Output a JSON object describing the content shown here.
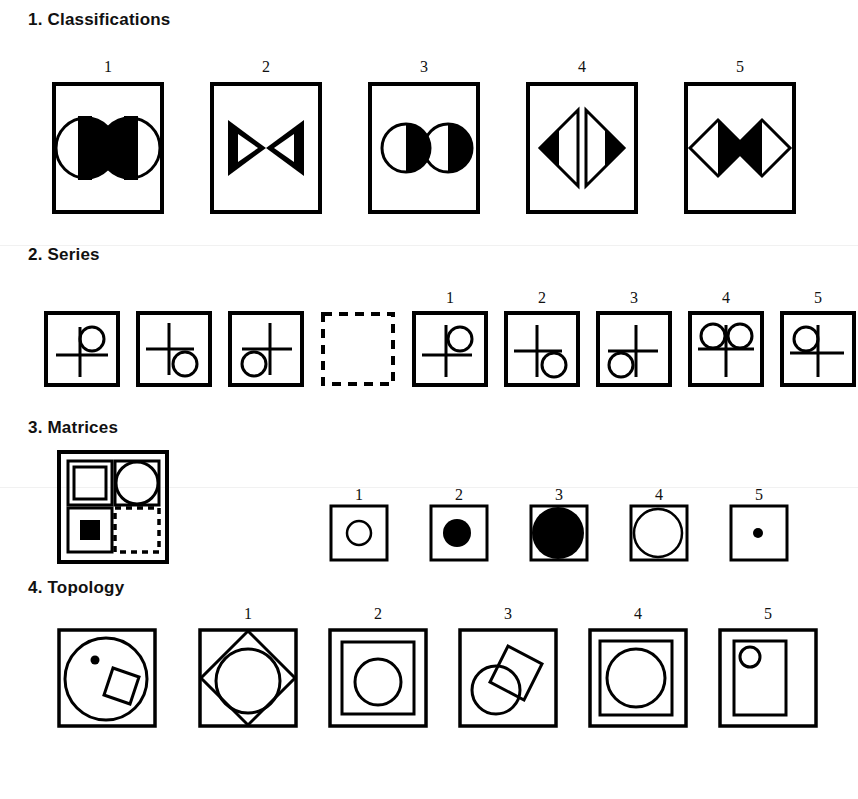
{
  "page": {
    "background_color": "#ffffff",
    "ink_color": "#000000",
    "width": 858,
    "height": 799
  },
  "sections": [
    {
      "id": "classifications",
      "number": "1.",
      "title": "1. Classifications",
      "title_x": 28,
      "title_y": 10,
      "kind": "classification",
      "stem": [],
      "options": [
        {
          "label": "1",
          "num_x": 108,
          "num_y": 58,
          "box_x": 52,
          "box_y": 82,
          "box_w": 112,
          "box_h": 132,
          "content": "two-circles-half-filled-inner"
        },
        {
          "label": "2",
          "num_x": 266,
          "num_y": 58,
          "box_x": 210,
          "box_y": 82,
          "box_w": 112,
          "box_h": 132,
          "content": "two-triangles-pointing-inward-filled"
        },
        {
          "label": "3",
          "num_x": 424,
          "num_y": 58,
          "box_x": 368,
          "box_y": 82,
          "box_w": 112,
          "box_h": 132,
          "content": "two-circles-right-half-filled"
        },
        {
          "label": "4",
          "num_x": 582,
          "num_y": 58,
          "box_x": 526,
          "box_y": 82,
          "box_w": 112,
          "box_h": 132,
          "content": "two-triangles-pointing-outward-half-filled"
        },
        {
          "label": "5",
          "num_x": 740,
          "num_y": 58,
          "box_x": 684,
          "box_y": 82,
          "box_w": 112,
          "box_h": 132,
          "content": "two-diamonds-half-filled-inner"
        }
      ]
    },
    {
      "id": "series",
      "number": "2.",
      "title": "2. Series",
      "title_x": 28,
      "title_y": 245,
      "kind": "series",
      "stem": [
        {
          "box_x": 44,
          "box_y": 311,
          "box_w": 76,
          "box_h": 76,
          "content": "cross-circle-top-right"
        },
        {
          "box_x": 136,
          "box_y": 311,
          "box_w": 76,
          "box_h": 76,
          "content": "cross-circle-bottom-right"
        },
        {
          "box_x": 228,
          "box_y": 311,
          "box_w": 76,
          "box_h": 76,
          "content": "cross-circle-bottom-left"
        },
        {
          "box_x": 320,
          "box_y": 311,
          "box_w": 76,
          "box_h": 76,
          "content": "empty-dashed-answer-slot"
        }
      ],
      "options": [
        {
          "label": "1",
          "num_x": 450,
          "num_y": 289,
          "box_x": 412,
          "box_y": 311,
          "box_w": 76,
          "box_h": 76,
          "content": "cross-circle-top-right"
        },
        {
          "label": "2",
          "num_x": 542,
          "num_y": 289,
          "box_x": 504,
          "box_y": 311,
          "box_w": 76,
          "box_h": 76,
          "content": "cross-circle-bottom-right"
        },
        {
          "label": "3",
          "num_x": 634,
          "num_y": 289,
          "box_x": 596,
          "box_y": 311,
          "box_w": 76,
          "box_h": 76,
          "content": "cross-circle-bottom-left"
        },
        {
          "label": "4",
          "num_x": 726,
          "num_y": 289,
          "box_x": 688,
          "box_y": 311,
          "box_w": 76,
          "box_h": 76,
          "content": "cross-two-circles-top"
        },
        {
          "label": "5",
          "num_x": 818,
          "num_y": 289,
          "box_x": 780,
          "box_y": 311,
          "box_w": 76,
          "box_h": 76,
          "content": "cross-circle-top-left"
        }
      ]
    },
    {
      "id": "matrices",
      "number": "3.",
      "title": "3. Matrices",
      "title_x": 28,
      "title_y": 418,
      "kind": "matrix",
      "stem": [
        {
          "box_x": 57,
          "box_y": 450,
          "box_w": 110,
          "box_h": 112,
          "content": "matrix-2x2-square-circle-smallfilledsquare-blank",
          "cells": [
            "large-outline-square",
            "large-outline-circle",
            "small-filled-square",
            "blank-dashed-cell"
          ]
        }
      ],
      "options": [
        {
          "label": "1",
          "num_x": 359,
          "num_y": 491,
          "box_x": 329,
          "box_y": 506,
          "box_w": 60,
          "box_h": 56,
          "content": "small-outline-circle"
        },
        {
          "label": "2",
          "num_x": 459,
          "num_y": 491,
          "box_x": 429,
          "box_y": 506,
          "box_w": 60,
          "box_h": 56,
          "content": "medium-filled-circle"
        },
        {
          "label": "3",
          "num_x": 559,
          "num_y": 491,
          "box_x": 529,
          "box_y": 506,
          "box_w": 60,
          "box_h": 56,
          "content": "large-filled-circle"
        },
        {
          "label": "4",
          "num_x": 659,
          "num_y": 491,
          "box_x": 629,
          "box_y": 506,
          "box_w": 60,
          "box_h": 56,
          "content": "large-outline-circle"
        },
        {
          "label": "5",
          "num_x": 759,
          "num_y": 491,
          "box_x": 729,
          "box_y": 506,
          "box_w": 60,
          "box_h": 56,
          "content": "tiny-filled-dot"
        }
      ]
    },
    {
      "id": "topology",
      "number": "4.",
      "title": "4. Topology",
      "title_x": 28,
      "title_y": 578,
      "kind": "topology",
      "stem": [
        {
          "box_x": 57,
          "box_y": 628,
          "box_w": 100,
          "box_h": 100,
          "content": "circle-with-dot-and-overlapping-tilted-square"
        }
      ],
      "options": [
        {
          "label": "1",
          "num_x": 248,
          "num_y": 608,
          "box_x": 198,
          "box_y": 628,
          "box_w": 100,
          "box_h": 100,
          "content": "square-diamond-circle-overlapping"
        },
        {
          "label": "2",
          "num_x": 378,
          "num_y": 608,
          "box_x": 328,
          "box_y": 628,
          "box_w": 100,
          "box_h": 100,
          "content": "nested-square-with-circle-inside"
        },
        {
          "label": "3",
          "num_x": 508,
          "num_y": 608,
          "box_x": 458,
          "box_y": 628,
          "box_w": 100,
          "box_h": 100,
          "content": "circle-and-tilted-square-overlapping"
        },
        {
          "label": "4",
          "num_x": 638,
          "num_y": 608,
          "box_x": 588,
          "box_y": 628,
          "box_w": 100,
          "box_h": 100,
          "content": "nested-square-with-large-circle-inside"
        },
        {
          "label": "5",
          "num_x": 768,
          "num_y": 608,
          "box_x": 718,
          "box_y": 628,
          "box_w": 100,
          "box_h": 100,
          "content": "nested-rectangle-with-small-circle-top-left"
        }
      ]
    }
  ]
}
